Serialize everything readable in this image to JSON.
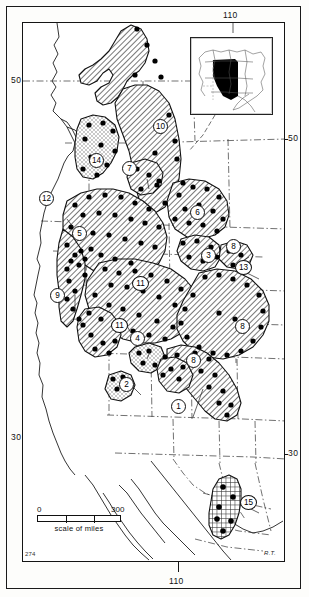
{
  "figure": {
    "type": "distribution-map",
    "region_described": "Western North America",
    "page_number": "274",
    "artist_signature": "R.T."
  },
  "graticule": {
    "longitude_labels": [
      {
        "value": "110",
        "position": "top"
      },
      {
        "value": "110",
        "position": "bottom"
      }
    ],
    "latitude_labels": [
      {
        "value": "50",
        "position": "left-upper"
      },
      {
        "value": "50",
        "position": "right-upper"
      },
      {
        "value": "30",
        "position": "left-lower"
      },
      {
        "value": "30",
        "position": "right-lower"
      }
    ]
  },
  "scale": {
    "min_label": "0",
    "max_label": "300",
    "caption": "scale of miles",
    "units": "miles"
  },
  "inset": {
    "name": "north-america-locator-inset",
    "highlight_color": "#000000",
    "description": "North America with western study area shaded black"
  },
  "map_regions": [
    {
      "id": 1,
      "label": "1",
      "pattern": "diagonal-hatch"
    },
    {
      "id": 2,
      "label": "2",
      "pattern": "stipple"
    },
    {
      "id": 3,
      "label": "3",
      "pattern": "diagonal-hatch"
    },
    {
      "id": 4,
      "label": "4",
      "pattern": "stipple"
    },
    {
      "id": 5,
      "label": "5",
      "pattern": "diagonal-hatch"
    },
    {
      "id": 6,
      "label": "6",
      "pattern": "diagonal-hatch"
    },
    {
      "id": 7,
      "label": "7",
      "pattern": "diagonal-hatch"
    },
    {
      "id": 8,
      "label": "8",
      "pattern": "diagonal-hatch"
    },
    {
      "id": 9,
      "label": "9",
      "pattern": "diagonal-hatch"
    },
    {
      "id": 10,
      "label": "10",
      "pattern": "diagonal-hatch"
    },
    {
      "id": 11,
      "label": "11",
      "pattern": "diagonal-hatch"
    },
    {
      "id": 12,
      "label": "12",
      "pattern": "diagonal-hatch"
    },
    {
      "id": 13,
      "label": "13",
      "pattern": "diagonal-hatch"
    },
    {
      "id": 14,
      "label": "14",
      "pattern": "stipple"
    },
    {
      "id": 15,
      "label": "15",
      "pattern": "cross-hatch"
    }
  ],
  "callouts": [
    {
      "label": "10",
      "x": 152,
      "y": 118
    },
    {
      "label": "14",
      "x": 88,
      "y": 152
    },
    {
      "label": "7",
      "x": 121,
      "y": 160
    },
    {
      "label": "12",
      "x": 38,
      "y": 190
    },
    {
      "label": "6",
      "x": 189,
      "y": 204
    },
    {
      "label": "5",
      "x": 71,
      "y": 225
    },
    {
      "label": "3",
      "x": 200,
      "y": 247
    },
    {
      "label": "8",
      "x": 225,
      "y": 238
    },
    {
      "label": "13",
      "x": 234,
      "y": 259
    },
    {
      "label": "9",
      "x": 49,
      "y": 287
    },
    {
      "label": "11",
      "x": 131,
      "y": 275
    },
    {
      "label": "8",
      "x": 234,
      "y": 318
    },
    {
      "label": "11",
      "x": 110,
      "y": 317
    },
    {
      "label": "4",
      "x": 129,
      "y": 330
    },
    {
      "label": "8",
      "x": 185,
      "y": 352
    },
    {
      "label": "2",
      "x": 118,
      "y": 376
    },
    {
      "label": "1",
      "x": 170,
      "y": 398
    },
    {
      "label": "15",
      "x": 239,
      "y": 494
    }
  ]
}
